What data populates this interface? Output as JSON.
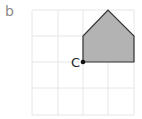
{
  "part_label": "b",
  "point_label": "C",
  "grid": {
    "cols": 4,
    "rows": 4,
    "x_lines": [
      32,
      58,
      83,
      108,
      134
    ],
    "y_lines": [
      10,
      36,
      62,
      88,
      115
    ],
    "line_color": "#e6e6e6"
  },
  "shape": {
    "type": "pentagon",
    "points": "83,62 83,36 108,10 134,36 134,62",
    "fill": "#b3b3b3",
    "stroke": "#333333"
  },
  "point": {
    "x": 83,
    "y": 62,
    "color": "#111111"
  }
}
